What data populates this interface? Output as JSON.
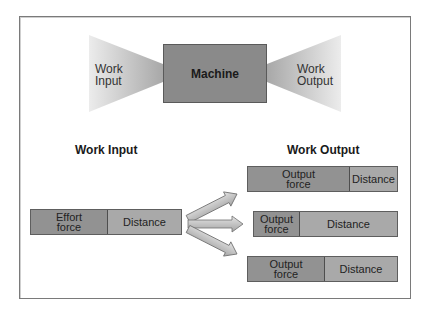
{
  "top_diagram": {
    "left_funnel_label": [
      "Work",
      "Input"
    ],
    "machine_label": "Machine",
    "right_funnel_label": [
      "Work",
      "Output"
    ]
  },
  "bottom_diagram": {
    "input_heading": "Work Input",
    "output_heading": "Work Output",
    "input_bar": {
      "force_label": [
        "Effort",
        "force"
      ],
      "distance_label": "Distance",
      "force_fraction": 0.5
    },
    "output_bars": [
      {
        "force_label": [
          "Output",
          "force"
        ],
        "distance_label": "Distance",
        "force_fraction": 0.67
      },
      {
        "force_label": [
          "Output",
          "force"
        ],
        "distance_label": "Distance",
        "force_fraction": 0.31
      },
      {
        "force_label": [
          "Output",
          "force"
        ],
        "distance_label": "Distance",
        "force_fraction": 0.5
      }
    ],
    "arrow_count": 3
  },
  "colors": {
    "frame_border": "#7a7a7a",
    "machine_fill": "#8a8a8a",
    "force_fill": "#929292",
    "distance_fill": "#a9a9a9",
    "funnel_dark": "#a8a8a8",
    "funnel_light": "#ececec"
  }
}
